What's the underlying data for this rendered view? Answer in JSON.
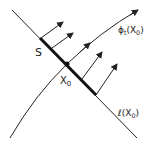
{
  "diagram": {
    "labels": {
      "segment": "S",
      "point": "X",
      "point_sub": "0",
      "curve": "ϕ",
      "curve_sub_t": "t",
      "curve_arg": "(X",
      "curve_arg_sub": "0",
      "curve_close": ")",
      "line": "ℓ",
      "line_arg": "(X",
      "line_arg_sub": "0",
      "line_close": ")"
    },
    "colors": {
      "stroke": "#222222",
      "background": "#ffffff"
    }
  }
}
